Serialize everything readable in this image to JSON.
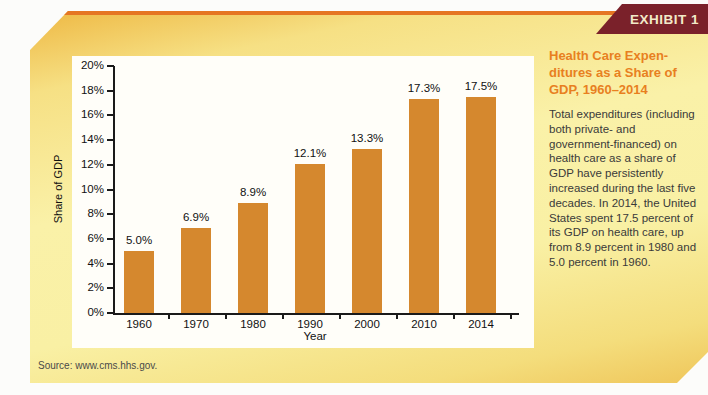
{
  "exhibit": {
    "label": "EXHIBIT 1"
  },
  "sidebar": {
    "title_lines": [
      "Health Care Expen-",
      "ditures as a Share of",
      "GDP, 1960–2014"
    ],
    "body": "Total expenditures (including both private- and government-financed) on health care as a share of GDP have persistently increased during the last five decades. In 2014, the United States spent 17.5 percent of its GDP on health care, up from 8.9 percent in 1980 and 5.0 percent in 1960."
  },
  "chart_data": {
    "type": "bar",
    "categories": [
      "1960",
      "1970",
      "1980",
      "1990",
      "2000",
      "2010",
      "2014"
    ],
    "values": [
      5.0,
      6.9,
      8.9,
      12.1,
      13.3,
      17.3,
      17.5
    ],
    "value_labels": [
      "5.0%",
      "6.9%",
      "8.9%",
      "12.1%",
      "13.3%",
      "17.3%",
      "17.5%"
    ],
    "xlabel": "Year",
    "ylabel": "Share of GDP",
    "ylim": [
      0,
      20
    ],
    "ytick_step": 2,
    "ytick_suffix": "%",
    "grid": false,
    "legend": null,
    "bar_color": "#d5882e"
  },
  "source": {
    "text": "Source: www.cms.hhs.gov."
  },
  "colors": {
    "banner_bg": "#7a212a",
    "banner_text": "#f2e9c8",
    "accent_line": "#e57623",
    "panel_gold": "#eeb843",
    "panel_pale": "#faf1a8",
    "sidebar_title": "#e8801f",
    "bar": "#d5882e",
    "axis": "#1a1a1a"
  }
}
